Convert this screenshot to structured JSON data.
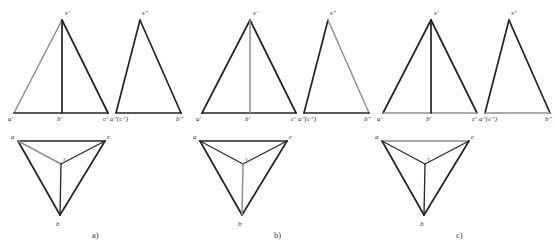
{
  "figure": {
    "colors": {
      "dark_line": "#232323",
      "gray_line": "#8f8f8f",
      "label_text": "#2b2b2b",
      "gray_label_text": "#7d7d7d",
      "background": "#ffffff"
    },
    "groups": [
      {
        "id": "a",
        "caption": "a)",
        "front_view": {
          "name": "front-view",
          "labels": {
            "apex": "s'",
            "left_base": "a'",
            "mid_base": "b'",
            "right_base": "c'"
          },
          "gray_segments": [
            "a'-s'"
          ]
        },
        "side_view": {
          "name": "side-view",
          "labels": {
            "apex": "s\"",
            "left_base": "a\"(c\")",
            "right_base": "b\""
          },
          "gray_segments": []
        },
        "top_view": {
          "name": "top-view",
          "labels": {
            "left": "a",
            "right": "c",
            "bottom": "b",
            "center": "s"
          },
          "gray_segments": [
            "a-s"
          ]
        }
      },
      {
        "id": "b",
        "caption": "b)",
        "front_view": {
          "name": "front-view",
          "labels": {
            "apex": "s'",
            "left_base": "a'",
            "mid_base": "b'",
            "right_base": "c'"
          },
          "gray_segments": [
            "s'-b'"
          ]
        },
        "side_view": {
          "name": "side-view",
          "labels": {
            "apex": "s\"",
            "left_base": "a\"(c\")",
            "right_base": "b\""
          },
          "gray_segments": [
            "s\"-b\""
          ]
        },
        "top_view": {
          "name": "top-view",
          "labels": {
            "left": "a",
            "right": "c",
            "bottom": "b",
            "center": "s"
          },
          "gray_segments": [
            "s-b"
          ]
        }
      },
      {
        "id": "c",
        "caption": "c)",
        "front_view": {
          "name": "front-view",
          "labels": {
            "apex": "s'",
            "left_base": "a'",
            "mid_base": "b'",
            "right_base": "c'"
          },
          "gray_segments": [
            "a'-c'"
          ]
        },
        "side_view": {
          "name": "side-view",
          "labels": {
            "apex": "s\"",
            "left_base": "a\"(c\")",
            "right_base": "b\""
          },
          "gray_segments": [
            "a\"-b\""
          ]
        },
        "top_view": {
          "name": "top-view",
          "labels": {
            "left": "a",
            "right": "c",
            "bottom": "b",
            "center": "s"
          },
          "gray_segments": [
            "a-c"
          ]
        }
      }
    ]
  }
}
